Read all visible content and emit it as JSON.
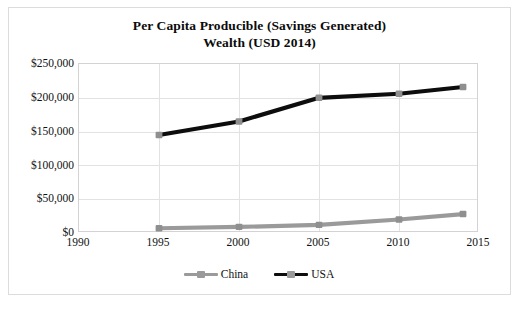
{
  "chart_data": {
    "type": "line",
    "title": "Per Capita Producible (Savings Generated) Wealth (USD 2014)",
    "title_line1": "Per Capita Producible (Savings Generated)",
    "title_line2": "Wealth (USD 2014)",
    "xlabel": "",
    "ylabel": "",
    "x": [
      1995,
      2000,
      2005,
      2010,
      2014
    ],
    "xlim": [
      1990,
      2015
    ],
    "ylim": [
      0,
      250000
    ],
    "xticks": [
      "1990",
      "1995",
      "2000",
      "2005",
      "2010",
      "2015"
    ],
    "xtick_values": [
      1990,
      1995,
      2000,
      2005,
      2010,
      2015
    ],
    "yticks": [
      "$0",
      "$50,000",
      "$100,000",
      "$150,000",
      "$200,000",
      "$250,000"
    ],
    "ytick_values": [
      0,
      50000,
      100000,
      150000,
      200000,
      250000
    ],
    "grid": true,
    "legend_position": "bottom",
    "series": [
      {
        "name": "China",
        "color": "#9a9a9a",
        "marker_color": "#8f8f8f",
        "values": [
          7000,
          9000,
          12000,
          20000,
          28000
        ]
      },
      {
        "name": "USA",
        "color": "#0d0d0d",
        "marker_color": "#8f8f8f",
        "values": [
          145000,
          165000,
          200000,
          206000,
          216000
        ]
      }
    ]
  },
  "legend": {
    "entries": [
      {
        "label": "China"
      },
      {
        "label": "USA"
      }
    ]
  },
  "caption": {
    "text": ""
  },
  "colors": {
    "china": "#9a9a9a",
    "usa": "#0d0d0d",
    "marker": "#8f8f8f",
    "grid": "#e2e2e2",
    "frame": "#dcdcdc",
    "text": "#111111",
    "background": "#ffffff"
  }
}
